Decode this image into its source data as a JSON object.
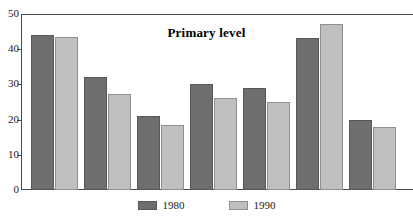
{
  "scan": {
    "top_remnant_text": ""
  },
  "chart_data": {
    "type": "bar",
    "title": "Primary level",
    "xlabel": "",
    "ylabel": "",
    "ylim": [
      0,
      50
    ],
    "yticks": [
      0,
      10,
      20,
      30,
      40,
      50
    ],
    "ytick_labels": [
      "0",
      "10",
      "20",
      "30",
      "40",
      "50"
    ],
    "grid": false,
    "legend_position": "bottom-center",
    "categories": [
      "1",
      "2",
      "3",
      "4",
      "5",
      "6",
      "7"
    ],
    "series": [
      {
        "name": "1980",
        "color": "#6e6e6e",
        "values": [
          44,
          32,
          21,
          30,
          29,
          43.2,
          20
        ]
      },
      {
        "name": "1990",
        "color": "#bfbfbf",
        "values": [
          43.5,
          27.3,
          18.5,
          26.2,
          25,
          47.2,
          18
        ]
      }
    ]
  },
  "legend": {
    "items": [
      {
        "label": "1980",
        "swatch": "dark-gray-swatch"
      },
      {
        "label": "1990",
        "swatch": "light-gray-swatch"
      }
    ]
  }
}
